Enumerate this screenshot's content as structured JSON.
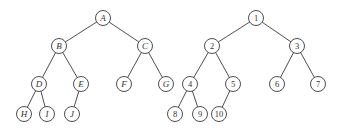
{
  "diagram": {
    "type": "binary-trees",
    "node_radius": 7.5,
    "stroke_color": "#3a3a3a",
    "trees": [
      {
        "name": "letter-tree",
        "label_style": "italic",
        "nodes": [
          {
            "id": "A",
            "label": "A",
            "x": 103,
            "y": 18
          },
          {
            "id": "B",
            "label": "B",
            "x": 59,
            "y": 46
          },
          {
            "id": "C",
            "label": "C",
            "x": 145,
            "y": 46
          },
          {
            "id": "D",
            "label": "D",
            "x": 39,
            "y": 84
          },
          {
            "id": "E",
            "label": "E",
            "x": 81,
            "y": 84
          },
          {
            "id": "F",
            "label": "F",
            "x": 124,
            "y": 84
          },
          {
            "id": "G",
            "label": "G",
            "x": 166,
            "y": 84
          },
          {
            "id": "H",
            "label": "H",
            "x": 24,
            "y": 114
          },
          {
            "id": "I",
            "label": "I",
            "x": 47,
            "y": 114
          },
          {
            "id": "J",
            "label": "J",
            "x": 72,
            "y": 114
          }
        ],
        "edges": [
          [
            "A",
            "B"
          ],
          [
            "A",
            "C"
          ],
          [
            "B",
            "D"
          ],
          [
            "B",
            "E"
          ],
          [
            "C",
            "F"
          ],
          [
            "C",
            "G"
          ],
          [
            "D",
            "H"
          ],
          [
            "D",
            "I"
          ],
          [
            "E",
            "J"
          ]
        ]
      },
      {
        "name": "number-tree",
        "label_style": "upright",
        "nodes": [
          {
            "id": "n1",
            "label": "1",
            "x": 256,
            "y": 18
          },
          {
            "id": "n2",
            "label": "2",
            "x": 212,
            "y": 46
          },
          {
            "id": "n3",
            "label": "3",
            "x": 297,
            "y": 46
          },
          {
            "id": "n4",
            "label": "4",
            "x": 190,
            "y": 84
          },
          {
            "id": "n5",
            "label": "5",
            "x": 233,
            "y": 84
          },
          {
            "id": "n6",
            "label": "6",
            "x": 277,
            "y": 84
          },
          {
            "id": "n7",
            "label": "7",
            "x": 318,
            "y": 84
          },
          {
            "id": "n8",
            "label": "8",
            "x": 175,
            "y": 114
          },
          {
            "id": "n9",
            "label": "9",
            "x": 200,
            "y": 114
          },
          {
            "id": "n10",
            "label": "10",
            "x": 219,
            "y": 114
          }
        ],
        "edges": [
          [
            "n1",
            "n2"
          ],
          [
            "n1",
            "n3"
          ],
          [
            "n2",
            "n4"
          ],
          [
            "n2",
            "n5"
          ],
          [
            "n3",
            "n6"
          ],
          [
            "n3",
            "n7"
          ],
          [
            "n4",
            "n8"
          ],
          [
            "n4",
            "n9"
          ],
          [
            "n5",
            "n10"
          ]
        ]
      }
    ]
  }
}
